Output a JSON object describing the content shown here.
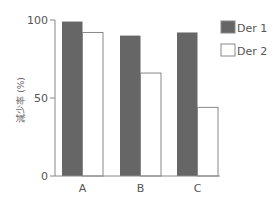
{
  "chart_data": {
    "type": "bar",
    "title": "",
    "xlabel": "",
    "ylabel": "減少率 (%)",
    "categories": [
      "A",
      "B",
      "C"
    ],
    "series": [
      {
        "name": "Der 1",
        "color": "#666666",
        "values": [
          99,
          90,
          92
        ]
      },
      {
        "name": "Der 2",
        "color": "#ffffff",
        "values": [
          92,
          66,
          44
        ]
      }
    ],
    "ylim": [
      0,
      100
    ],
    "yticks": [
      0,
      50,
      100
    ],
    "grid": false,
    "legend_position": "top-right"
  },
  "axis": {
    "ytick_labels": [
      "0",
      "50",
      "100"
    ],
    "ylabel": "減少率 (%)"
  },
  "legend": {
    "items": [
      {
        "label": "Der 1",
        "color": "#666666"
      },
      {
        "label": "Der 2",
        "color": "#ffffff"
      }
    ]
  }
}
